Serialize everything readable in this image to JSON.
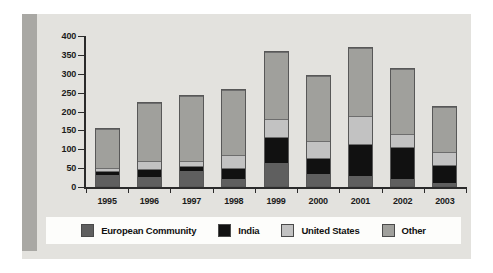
{
  "chart_data": {
    "type": "bar",
    "stacked": true,
    "title": "",
    "xlabel": "",
    "ylabel": "",
    "ylim": [
      0,
      400
    ],
    "yticks": [
      0,
      50,
      100,
      150,
      200,
      250,
      300,
      350,
      400
    ],
    "grid": false,
    "legend_position": "bottom",
    "categories": [
      "1995",
      "1996",
      "1997",
      "1998",
      "1999",
      "2000",
      "2001",
      "2002",
      "2003"
    ],
    "series": [
      {
        "name": "European Community",
        "color": "#5f5f5f",
        "values": [
          30,
          25,
          40,
          20,
          63,
          32,
          28,
          20,
          8
        ]
      },
      {
        "name": "India",
        "color": "#111111",
        "values": [
          10,
          20,
          13,
          30,
          70,
          43,
          85,
          85,
          50
        ]
      },
      {
        "name": "United States",
        "color": "#c2c2c2",
        "values": [
          8,
          22,
          15,
          35,
          47,
          47,
          75,
          35,
          35
        ]
      },
      {
        "name": "Other",
        "color": "#a0a09c",
        "values": [
          109,
          158,
          177,
          174,
          179,
          175,
          184,
          176,
          122
        ]
      }
    ],
    "totals": [
      157,
      225,
      245,
      259,
      359,
      297,
      372,
      316,
      215
    ]
  },
  "legend": {
    "items": [
      {
        "label": "European Community",
        "swatch": "legend-swatch-european-community"
      },
      {
        "label": "India",
        "swatch": "legend-swatch-india"
      },
      {
        "label": "United States",
        "swatch": "legend-swatch-united-states"
      },
      {
        "label": "Other",
        "swatch": "legend-swatch-other"
      }
    ]
  },
  "colors": {
    "background": "#e3e2de",
    "gutter": "#a9a8a4",
    "axis": "#2b2b2b",
    "legend_background": "#fdfdfb",
    "european_community": "#5f5f5f",
    "india": "#111111",
    "united_states": "#c2c2c2",
    "other": "#a0a09c"
  }
}
